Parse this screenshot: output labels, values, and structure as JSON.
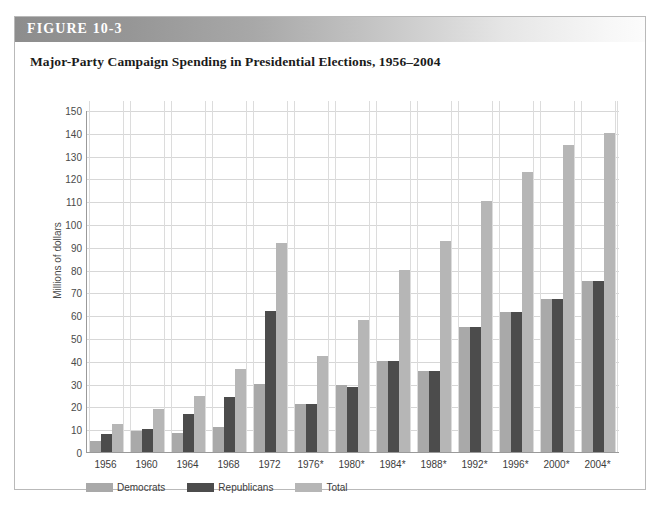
{
  "figure": {
    "label": "FIGURE 10-3",
    "title": "Major-Party Campaign Spending in Presidential Elections, 1956–2004"
  },
  "chart_data": {
    "type": "bar",
    "title": "Major-Party Campaign Spending in Presidential Elections, 1956–2004",
    "xlabel": "",
    "ylabel": "Millions of dollars",
    "ylim": [
      0,
      150
    ],
    "ytick_step": 10,
    "yticks": [
      0,
      10,
      20,
      30,
      40,
      50,
      60,
      70,
      80,
      90,
      100,
      110,
      120,
      130,
      140,
      150
    ],
    "grid": true,
    "legend_position": "bottom-left",
    "categories": [
      "1956",
      "1960",
      "1964",
      "1968",
      "1972",
      "1976*",
      "1980*",
      "1984*",
      "1988*",
      "1992*",
      "1996*",
      "2000*",
      "2004*"
    ],
    "series": [
      {
        "name": "Democrats",
        "color": "#a9a9a9",
        "values": [
          5,
          9,
          8.5,
          11,
          30,
          21,
          29.5,
          40,
          35.5,
          55,
          61.5,
          67,
          75
        ]
      },
      {
        "name": "Republicans",
        "color": "#4c4c4c",
        "values": [
          8,
          10,
          16.5,
          24,
          62,
          21,
          28.5,
          40,
          35.5,
          55,
          61.5,
          67,
          75
        ]
      },
      {
        "name": "Total",
        "color": "#b6b6b6",
        "values": [
          12.5,
          19,
          24.5,
          36.5,
          91.5,
          42,
          58,
          80,
          92.5,
          110,
          123,
          134.5,
          140
        ]
      }
    ]
  },
  "legend": {
    "items": [
      {
        "label": "Democrats",
        "color": "#a9a9a9"
      },
      {
        "label": "Republicans",
        "color": "#4c4c4c"
      },
      {
        "label": "Total",
        "color": "#b6b6b6"
      }
    ]
  }
}
